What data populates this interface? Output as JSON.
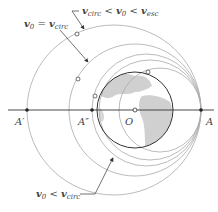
{
  "diagram": {
    "points": {
      "A": "A",
      "A_prime": "A′",
      "A_double_prime": "A″",
      "O": "O"
    },
    "annotations": {
      "circular": {
        "v": "v",
        "sub0": "0",
        "eq": " = ",
        "v2": "v",
        "sub2": "circ"
      },
      "between": {
        "v": "v",
        "sub1": "circ",
        "lt": " < ",
        "v2": "v",
        "sub2": "0",
        "lt2": " < ",
        "v3": "v",
        "sub3": "esc"
      },
      "less": {
        "v": "v",
        "sub0": "0",
        "lt": " < ",
        "v2": "v",
        "sub2": "circ"
      }
    },
    "colors": {
      "orbit": "#aaaaaa",
      "earth_outline": "#333333",
      "land": "#d0d0d0",
      "axis": "#333333",
      "text": "#444444"
    }
  }
}
